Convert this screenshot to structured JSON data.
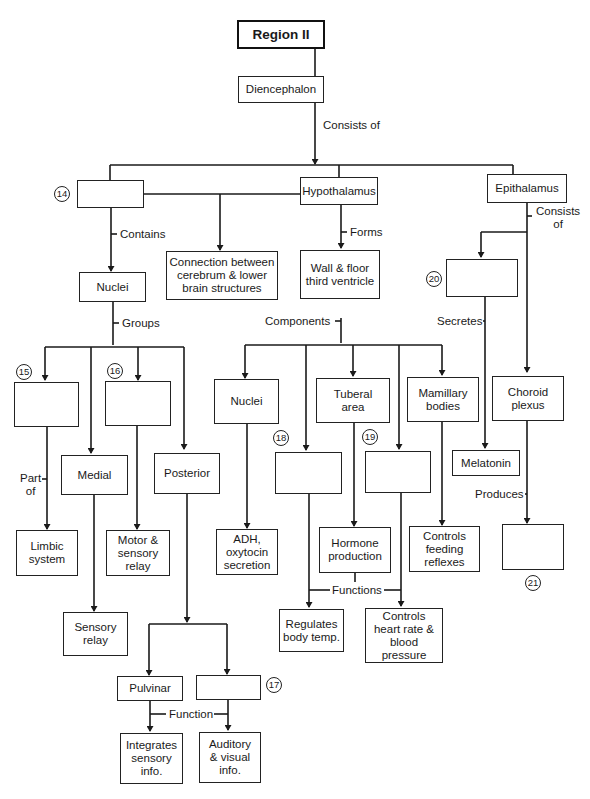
{
  "diagram": {
    "title": "Region II",
    "nodes": {
      "diencephalon": "Diencephalon",
      "blank14": "",
      "hypothalamus": "Hypothalamus",
      "epithalamus": "Epithalamus",
      "connection": "Connection between\ncerebrum & lower\nbrain structures",
      "nuclei_thal": "Nuclei",
      "wall_floor": "Wall & floor\nthird ventricle",
      "blank20": "",
      "blank15": "",
      "medial": "Medial",
      "blank16": "",
      "posterior": "Posterior",
      "nuclei_hypo": "Nuclei",
      "blank18": "",
      "tuberal": "Tuberal\narea",
      "blank19": "",
      "mamillary": "Mamillary\nbodies",
      "melatonin": "Melatonin",
      "choroid": "Choroid\nplexus",
      "limbic": "Limbic\nsystem",
      "motor_sensory": "Motor &\nsensory\nrelay",
      "adh": "ADH,\noxytocin\nsecretion",
      "hormone": "Hormone\nproduction",
      "feeding": "Controls\nfeeding\nreflexes",
      "blank21": "",
      "sensory_relay": "Sensory\nrelay",
      "body_temp": "Regulates\nbody temp.",
      "heart_rate": "Controls\nheart rate &\nblood pressure",
      "pulvinar": "Pulvinar",
      "blank17": "",
      "integrates": "Integrates\nsensory\ninfo.",
      "auditory": "Auditory\n& visual\ninfo."
    },
    "edge_labels": {
      "consists_of": "Consists of",
      "contains": "Contains",
      "forms": "Forms",
      "consists_of_epi": "Consists\nof",
      "groups": "Groups",
      "components": "Components",
      "secretes": "Secretes",
      "part_of": "Part\nof",
      "produces": "Produces",
      "functions": "Functions",
      "function": "Function"
    },
    "blank_numbers": {
      "n14": "14",
      "n15": "15",
      "n16": "16",
      "n17": "17",
      "n18": "18",
      "n19": "19",
      "n20": "20",
      "n21": "21"
    }
  }
}
